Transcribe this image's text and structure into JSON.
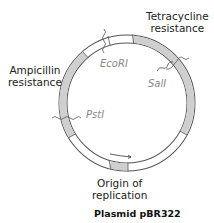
{
  "title": "Plasmid pBR322",
  "genes": {
    "tetracycline": {
      "line1": "Tetracycline",
      "line2": "resistance"
    },
    "ampicillin": {
      "line1": "Ampicillin",
      "line2": "resistance"
    },
    "origin": {
      "line1": "Origin of",
      "line2": "replication"
    }
  },
  "sites": {
    "ecori": "EcoRI",
    "sali": "SalI",
    "psti": "PstI"
  },
  "colors": {
    "ring_fill": "#d0d0d0",
    "ring_stroke": "#555555",
    "ring_white": "#ffffff"
  }
}
